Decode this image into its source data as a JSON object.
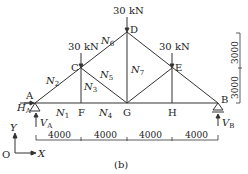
{
  "figure": {
    "caption": "(b)",
    "colors": {
      "line": "#333333",
      "text": "#222222",
      "background": "#ffffff"
    }
  },
  "nodes": {
    "A": {
      "label": "A",
      "x": 35,
      "y": 103
    },
    "F": {
      "label": "F",
      "x": 81,
      "y": 103
    },
    "G": {
      "label": "G",
      "x": 127,
      "y": 103
    },
    "H": {
      "label": "H",
      "x": 172,
      "y": 103
    },
    "B": {
      "label": "B",
      "x": 218,
      "y": 103
    },
    "C": {
      "label": "C",
      "x": 81,
      "y": 68
    },
    "D": {
      "label": "D",
      "x": 127,
      "y": 32
    },
    "E": {
      "label": "E",
      "x": 172,
      "y": 68
    }
  },
  "members": [
    {
      "name": "N1",
      "label": "N",
      "sub": "1"
    },
    {
      "name": "N2",
      "label": "N",
      "sub": "2"
    },
    {
      "name": "N3",
      "label": "N",
      "sub": "3"
    },
    {
      "name": "N4",
      "label": "N",
      "sub": "4"
    },
    {
      "name": "N5",
      "label": "N",
      "sub": "5"
    },
    {
      "name": "N6",
      "label": "N",
      "sub": "6"
    },
    {
      "name": "N7",
      "label": "N",
      "sub": "7"
    }
  ],
  "loads": [
    {
      "node": "C",
      "label": "30 kN"
    },
    {
      "node": "D",
      "label": "30 kN"
    },
    {
      "node": "E",
      "label": "30 kN"
    }
  ],
  "reactions": {
    "HA": {
      "label": "H",
      "sub": "A"
    },
    "VA": {
      "label": "V",
      "sub": "A"
    },
    "VB": {
      "label": "V",
      "sub": "B"
    }
  },
  "axes": {
    "origin": "O",
    "x": "X",
    "y": "Y"
  },
  "dimensions": {
    "horizontal": [
      "4000",
      "4000",
      "4000",
      "4000"
    ],
    "vertical": [
      "3000",
      "3000"
    ]
  }
}
